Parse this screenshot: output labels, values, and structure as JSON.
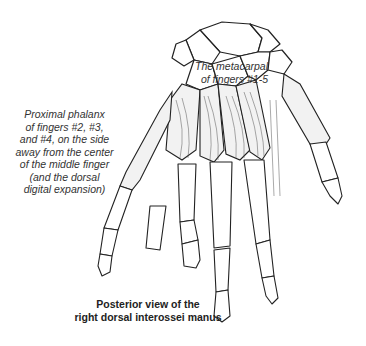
{
  "figure": {
    "labels": {
      "metacarpal": [
        "The metacarpal",
        "of fingers #1-5"
      ],
      "proximal_phalanx": [
        "Proximal phalanx",
        "of fingers #2, #3,",
        "and #4, on the side",
        "away from the center",
        "of the middle finger",
        "(and the dorsal",
        "digital expansion)"
      ]
    },
    "caption": [
      "Posterior view of the",
      "right dorsal interossei manus"
    ],
    "colors": {
      "line": "#222222",
      "stipple": "#888888",
      "background": "#ffffff"
    }
  }
}
